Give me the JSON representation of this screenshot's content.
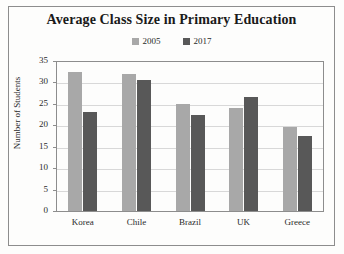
{
  "chart_data": {
    "type": "bar",
    "title": "Average Class Size in Primary Education",
    "xlabel": "",
    "ylabel": "Number of Students",
    "categories": [
      "Korea",
      "Chile",
      "Brazil",
      "UK",
      "Greece"
    ],
    "series": [
      {
        "name": "2005",
        "color": "#a8a8a8",
        "values": [
          32.5,
          32,
          25,
          24,
          19.5
        ]
      },
      {
        "name": "2017",
        "color": "#585858",
        "values": [
          23,
          30.5,
          22.5,
          26.5,
          17.5
        ]
      }
    ],
    "ylim": [
      0,
      35
    ],
    "ytick_step": 5,
    "yticks": [
      "0",
      "5",
      "10",
      "15",
      "20",
      "25",
      "30",
      "35"
    ],
    "grid": true,
    "legend_position": "top-center"
  },
  "legend": {
    "entries": [
      {
        "label": "2005",
        "color": "#a8a8a8"
      },
      {
        "label": "2017",
        "color": "#585858"
      }
    ]
  },
  "colors": {
    "series_2005": "#a8a8a8",
    "series_2017": "#585858",
    "axis": "#8d8d8d",
    "gridline": "#d8d8d8",
    "text": "#2a2a2a",
    "background": "#fdfdfc"
  }
}
